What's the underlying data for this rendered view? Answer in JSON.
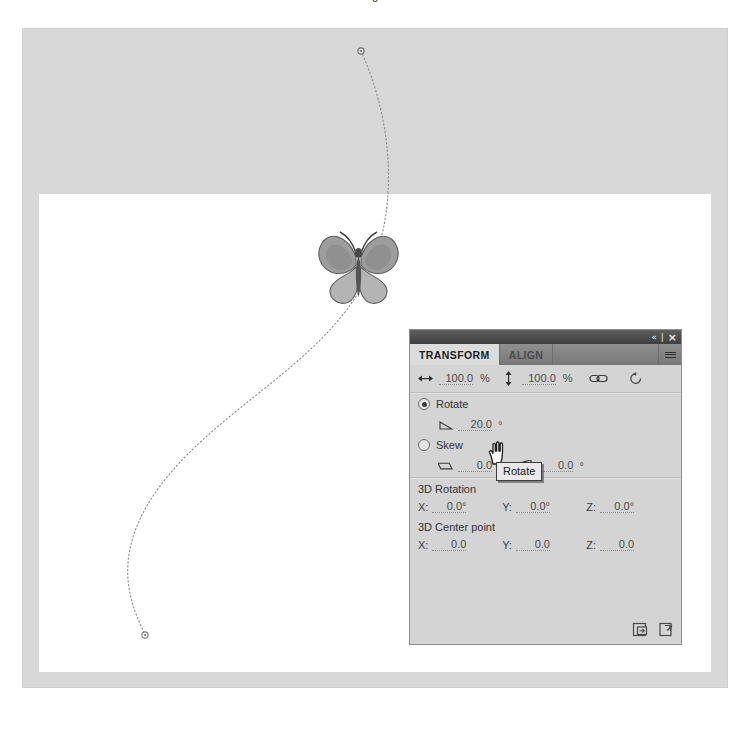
{
  "caption_remnant": "g",
  "workspace": {
    "pasteboard_color": "#d8d8d8",
    "stage_color": "#ffffff",
    "motion_path_color": "#8d8d8d",
    "anchor_point_color": "#6d6d6d"
  },
  "artwork": {
    "name": "butterfly-symbol",
    "body_color": "#6e6e6e",
    "wing_color": "#a8a8a8",
    "wing_shade": "#8c8c8c"
  },
  "panel": {
    "titlebar": {
      "collapse_icon": "«",
      "divider": "|",
      "close_icon": "×"
    },
    "tabs": [
      {
        "label": "TRANSFORM",
        "active": true
      },
      {
        "label": "ALIGN",
        "active": false
      }
    ],
    "menu_icon": "panel-options-icon",
    "scale": {
      "width_icon": "scale-width-icon",
      "width_value": "100.0",
      "width_unit": "%",
      "height_icon": "scale-height-icon",
      "height_value": "100.0",
      "height_unit": "%",
      "constrain_icon": "constrain-link-icon",
      "reset_icon": "reset-transform-icon"
    },
    "rotate": {
      "radio_label": "Rotate",
      "selected": true,
      "angle_icon": "rotate-angle-icon",
      "angle_value": "20.0",
      "angle_unit": "°"
    },
    "skew": {
      "radio_label": "Skew",
      "selected": false,
      "horizontal_icon": "skew-horizontal-icon",
      "horizontal_value": "0.0",
      "horizontal_unit": "°",
      "vertical_icon": "skew-vertical-icon",
      "vertical_value": "0.0",
      "vertical_unit": "°"
    },
    "rotation_3d": {
      "title": "3D Rotation",
      "x_label": "X:",
      "x_value": "0.0°",
      "y_label": "Y:",
      "y_value": "0.0°",
      "z_label": "Z:",
      "z_value": "0.0°"
    },
    "center_point_3d": {
      "title": "3D Center point",
      "x_label": "X:",
      "x_value": "0.0",
      "y_label": "Y:",
      "y_value": "0.0",
      "z_label": "Z:",
      "z_value": "0.0"
    },
    "footer": {
      "duplicate_icon": "duplicate-selection-and-transform-icon",
      "remove_icon": "remove-transform-icon"
    }
  },
  "cursor": {
    "type": "hand-pointer",
    "tooltip": "Rotate"
  }
}
